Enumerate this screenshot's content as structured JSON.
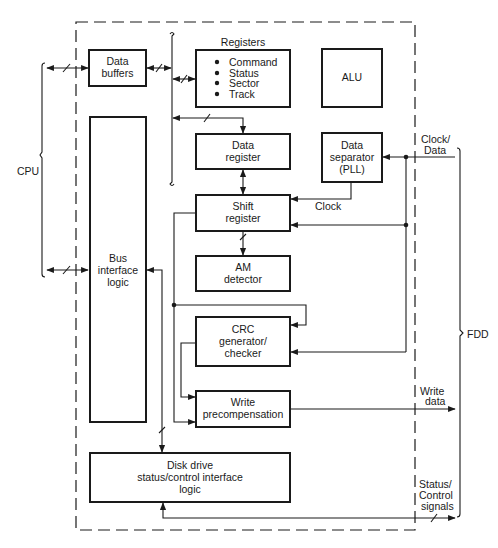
{
  "diagram": {
    "type": "block-diagram",
    "external": {
      "cpu_label": "CPU",
      "fdd_label": "FDD"
    },
    "blocks": {
      "data_buffers": {
        "line1": "Data",
        "line2": "buffers"
      },
      "registers": {
        "title": "Registers",
        "items": [
          "Command",
          "Status",
          "Sector",
          "Track"
        ]
      },
      "alu": {
        "line1": "ALU"
      },
      "data_register": {
        "line1": "Data",
        "line2": "register"
      },
      "data_separator": {
        "line1": "Data",
        "line2": "separator",
        "line3": "(PLL)"
      },
      "shift_register": {
        "line1": "Shift",
        "line2": "register"
      },
      "am_detector": {
        "line1": "AM",
        "line2": "detector"
      },
      "bus_interface": {
        "line1": "Bus",
        "line2": "interface",
        "line3": "logic"
      },
      "crc": {
        "line1": "CRC",
        "line2": "generator/",
        "line3": "checker"
      },
      "write_precomp": {
        "line1": "Write",
        "line2": "precompensation"
      },
      "disk_drive": {
        "line1": "Disk drive",
        "line2": "status/control interface",
        "line3": "logic"
      }
    },
    "signals": {
      "clock_data": {
        "line1": "Clock/",
        "line2": "Data"
      },
      "clock": "Clock",
      "write_data": {
        "line1": "Write",
        "line2": "data"
      },
      "status_control": {
        "line1": "Status/",
        "line2": "Control",
        "line3": "signals"
      }
    }
  }
}
